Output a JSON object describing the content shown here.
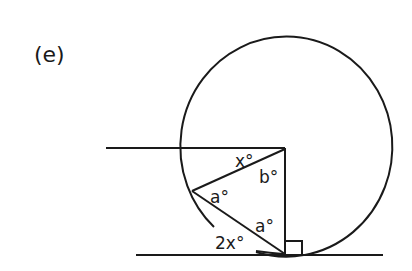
{
  "figure": {
    "part_label": "(e)"
  },
  "diagram": {
    "stroke_color": "#1a1a1a",
    "background": "#ffffff",
    "labels": {
      "x_angle": "x°",
      "b_angle": "b°",
      "a_angle_left": "a°",
      "a_angle_right": "a°",
      "two_x_angle": "2x°"
    },
    "elements": [
      "circle",
      "horizontal line meeting radius at top of vertical",
      "vertical diameter segment to tangent point",
      "tangent line at bottom",
      "chord from top-right corner to point on circle",
      "chord from point on circle to tangent point",
      "right-angle marker at tangent point"
    ]
  }
}
